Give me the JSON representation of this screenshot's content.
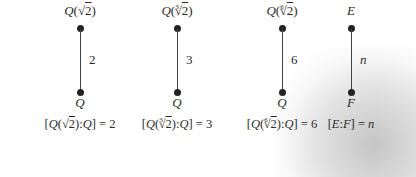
{
  "diagram": {
    "type": "field-extension-towers",
    "towers": [
      {
        "top_field": "Q(√2)",
        "top_base": "Q",
        "top_index": "",
        "top_radicand": "2",
        "bottom_field": "Q",
        "degree": "2",
        "equation": "[Q(√2):Q] = 2",
        "eq_field": "Q",
        "eq_index": "",
        "eq_radicand": "2",
        "eq_base": "Q",
        "eq_value": "2"
      },
      {
        "top_field": "Q(∛2)",
        "top_base": "Q",
        "top_index": "3",
        "top_radicand": "2",
        "bottom_field": "Q",
        "degree": "3",
        "equation": "[Q(∛2):Q] = 3",
        "eq_field": "Q",
        "eq_index": "3",
        "eq_radicand": "2",
        "eq_base": "Q",
        "eq_value": "3"
      },
      {
        "top_field": "Q(⁶√2)",
        "top_base": "Q",
        "top_index": "6",
        "top_radicand": "2",
        "bottom_field": "Q",
        "degree": "6",
        "equation": "[Q(⁶√2):Q] = 6",
        "eq_field": "Q",
        "eq_index": "6",
        "eq_radicand": "2",
        "eq_base": "Q",
        "eq_value": "6"
      },
      {
        "top_field": "E",
        "bottom_field": "F",
        "degree": "n",
        "equation": "[E:F] = n",
        "eq_top": "E",
        "eq_bottom": "F",
        "eq_value": "n"
      }
    ]
  },
  "symbols": {
    "sqrt": "√",
    "open_paren": "(",
    "close_paren": ")",
    "open_bracket": "[",
    "close_bracket": "]",
    "colon": ":",
    "equals": " = "
  }
}
